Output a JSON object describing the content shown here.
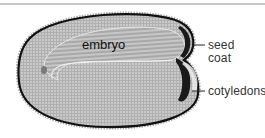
{
  "figure": {
    "type": "seed cross-section micrograph",
    "labels": {
      "embryo": "embryo",
      "seed_coat_line1": "seed",
      "seed_coat_line2": "coat",
      "cotyledons": "cotyledons"
    },
    "colors": {
      "tissue": "#a9a9a9",
      "tissue_light": "#c4c4c4",
      "seed_coat": "#111111",
      "label_text": "#333333",
      "divider": "#c8c8c8"
    }
  }
}
